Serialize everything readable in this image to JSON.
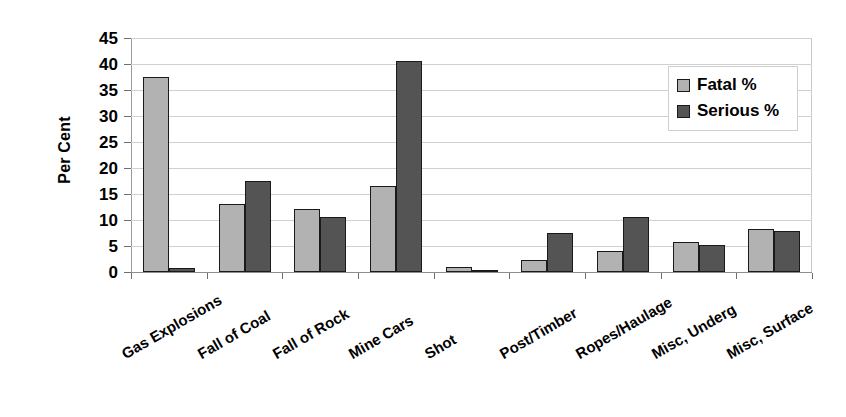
{
  "chart_data": {
    "type": "bar",
    "title": "",
    "xlabel": "",
    "ylabel": "Per Cent",
    "ylim": [
      0,
      45
    ],
    "yticks": [
      0,
      5,
      10,
      15,
      20,
      25,
      30,
      35,
      40,
      45
    ],
    "ytick_labels": [
      "0",
      "5",
      "10",
      "15",
      "20",
      "25",
      "30",
      "35",
      "40",
      "45"
    ],
    "grid": true,
    "legend_position": "top-right",
    "categories": [
      "Gas Explosions",
      "Fall of Coal",
      "Fall of Rock",
      "Mine Cars",
      "Shot",
      "Post/Timber",
      "Ropes/Haulage",
      "Misc, Underg",
      "Misc, Surface"
    ],
    "series": [
      {
        "name": "Fatal %",
        "color": "#b2b2b2",
        "values": [
          37.5,
          13.0,
          12.1,
          16.5,
          1.0,
          2.4,
          4.0,
          5.7,
          8.3
        ]
      },
      {
        "name": "Serious %",
        "color": "#545454",
        "values": [
          0.8,
          17.5,
          10.6,
          40.5,
          0.4,
          7.5,
          10.6,
          5.2,
          7.8
        ]
      }
    ]
  },
  "legend": {
    "items": [
      {
        "label": "Fatal %",
        "swatch": "fatal"
      },
      {
        "label": "Serious %",
        "swatch": "serious"
      }
    ]
  }
}
